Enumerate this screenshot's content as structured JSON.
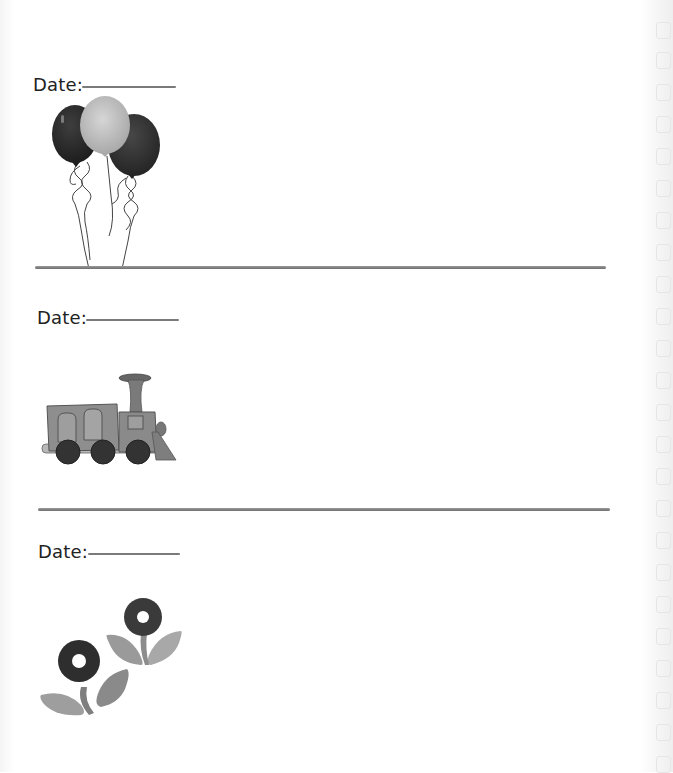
{
  "page": {
    "type": "scrapbook journal page",
    "background_color": "#ffffff",
    "ink_color": "#222222",
    "line_color": "#7a7a7a"
  },
  "entries": [
    {
      "date_label": "Date:",
      "date_value": "",
      "illustration": "balloons-icon"
    },
    {
      "date_label": "Date:",
      "date_value": "",
      "illustration": "train-icon"
    },
    {
      "date_label": "Date:",
      "date_value": "",
      "illustration": "flowers-icon"
    }
  ],
  "binder_holes": {
    "count": 24
  }
}
